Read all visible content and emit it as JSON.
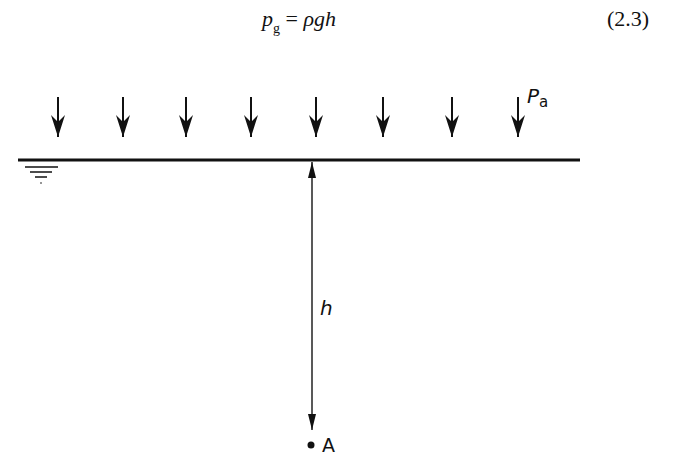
{
  "equation": {
    "lhs_var": "p",
    "lhs_sub": "g",
    "equals": " = ",
    "rhs": "ρgh",
    "number": "(2.3)"
  },
  "diagram": {
    "pressure_label": "P",
    "pressure_sub": "a",
    "depth_label": "h",
    "point_label": "A",
    "arrow_count": 8,
    "line_color": "#111111"
  }
}
